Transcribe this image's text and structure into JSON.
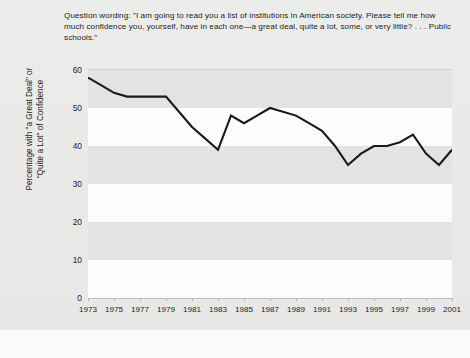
{
  "question": {
    "label": "Question wording:",
    "text": "Question wording: \"I am going to read you a list of institutions in American society. Please tell me how much confidence you, yourself, have in each one—a great deal, quite a lot, some, or very little? . . . Public schools.\""
  },
  "axis": {
    "y_title_line1": "Percentage with \"a Great Deal\" or",
    "y_title_line2": "\"Quite a Lot\" of Confidence"
  },
  "colors": {
    "page_background": "#ebebeb",
    "band_white": "#fdfdfd",
    "band_gray": "#e3e3e2",
    "line": "#1a1a1a",
    "text": "#1f1f1f"
  },
  "chart_data": {
    "type": "line",
    "title": "",
    "subtitle": "",
    "xlabel": "",
    "ylabel": "Percentage with \"a Great Deal\" or \"Quite a Lot\" of Confidence",
    "xlim": [
      1973,
      2001
    ],
    "ylim": [
      0,
      60
    ],
    "yticks": [
      0,
      10,
      20,
      30,
      40,
      50,
      60
    ],
    "ytick_labels": [
      "0",
      "10",
      "20",
      "30",
      "40",
      "50",
      "60"
    ],
    "xticks": [
      1973,
      1975,
      1977,
      1979,
      1981,
      1983,
      1985,
      1987,
      1989,
      1991,
      1993,
      1995,
      1997,
      1999,
      2001
    ],
    "xtick_labels": [
      "1973",
      "1975",
      "1977",
      "1979",
      "1981",
      "1983",
      "1985",
      "1987",
      "1989",
      "1991",
      "1993",
      "1995",
      "1997",
      "1999",
      "2001"
    ],
    "grid": "horizontal-bands",
    "legend": "none",
    "x": [
      1973,
      1974,
      1975,
      1976,
      1977,
      1978,
      1979,
      1980,
      1981,
      1982,
      1983,
      1984,
      1985,
      1986,
      1987,
      1988,
      1989,
      1990,
      1991,
      1992,
      1993,
      1994,
      1995,
      1996,
      1997,
      1998,
      1999,
      2000,
      2001
    ],
    "series": [
      {
        "name": "Confidence in public schools",
        "values": [
          58,
          56,
          54,
          53,
          53,
          53,
          53,
          49,
          45,
          42,
          39,
          48,
          46,
          48,
          50,
          49,
          48,
          46,
          44,
          40,
          35,
          38,
          40,
          40,
          41,
          43,
          38,
          35,
          39
        ]
      }
    ],
    "points": [
      {
        "year": 1973,
        "value": 58
      },
      {
        "year": 1975,
        "value": 54
      },
      {
        "year": 1977,
        "value": 53
      },
      {
        "year": 1979,
        "value": 53
      },
      {
        "year": 1981,
        "value": 45
      },
      {
        "year": 1983,
        "value": 39
      },
      {
        "year": 1985,
        "value": 46
      },
      {
        "year": 1987,
        "value": 50
      },
      {
        "year": 1989,
        "value": 48
      },
      {
        "year": 1991,
        "value": 44
      },
      {
        "year": 1993,
        "value": 35
      },
      {
        "year": 1995,
        "value": 40
      },
      {
        "year": 1997,
        "value": 41
      },
      {
        "year": 1999,
        "value": 38
      },
      {
        "year": 2001,
        "value": 39
      }
    ]
  }
}
